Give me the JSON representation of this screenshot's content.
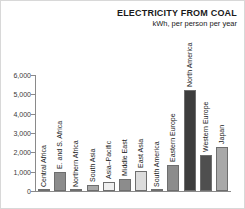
{
  "chart_data": {
    "type": "bar",
    "title": "ELECTRICITY FROM COAL",
    "subtitle": "kWh, per person per year",
    "xlabel": "",
    "ylabel": "",
    "ylim": [
      0,
      6000
    ],
    "yticks": [
      "0",
      "1,000",
      "2,000",
      "3,000",
      "4,000",
      "5,000",
      "6,000"
    ],
    "ytick_values": [
      0,
      1000,
      2000,
      3000,
      4000,
      5000,
      6000
    ],
    "grid": false,
    "legend": "none",
    "categories": [
      "Central Africa",
      "E. and S. Africa",
      "Northern Africa",
      "South Asia",
      "Asia–Pacific",
      "Middle East",
      "East Asia",
      "South America",
      "Eastern Europe",
      "North America",
      "Western Europe",
      "Japan"
    ],
    "values": [
      10,
      960,
      30,
      290,
      460,
      620,
      1050,
      50,
      1330,
      5200,
      1850,
      2300
    ],
    "bar_colors": [
      "#f2f2f2",
      "#8c8c8c",
      "#f2f2f2",
      "#a8a8a8",
      "#efefef",
      "#8c8c8c",
      "#dcdcdc",
      "#efefef",
      "#8c8c8c",
      "#3d3d3d",
      "#4f4f4f",
      "#a8a8a8"
    ]
  },
  "colors": {
    "axis": "#8a8a8a",
    "text": "#1a1a1a",
    "tick_text": "#3a3a3a",
    "background": "#ffffff",
    "bar_outline": "#6e6e6e"
  }
}
